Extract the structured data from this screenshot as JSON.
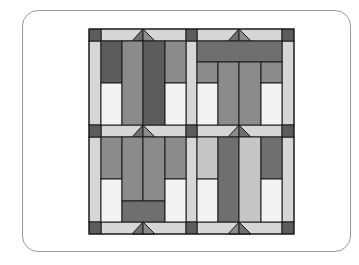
{
  "diagram": {
    "title": "",
    "type": "quilt-block-layout",
    "layout": "2x2 blocks with sashing strips and cornerstones",
    "colors": {
      "dark": "#5c5c5c",
      "medium_dark": "#6f6f6f",
      "medium": "#8b8b8b",
      "light_gray": "#c6c6c6",
      "sashing": "#d6d6d6",
      "white": "#f3f3f3",
      "outline": "#1a1a1a",
      "frame": "#9a9a9a"
    },
    "blocks": [
      {
        "position": "top-left",
        "description": "dark columns flanking, two tall center columns, white lower corners"
      },
      {
        "position": "top-right",
        "description": "horizontal bar on top, two tall center columns, white lower corners"
      },
      {
        "position": "bottom-left",
        "description": "two tall center columns over horizontal bar, white lower corners"
      },
      {
        "position": "bottom-right",
        "description": "light and dark tall columns, white lower corners"
      }
    ]
  }
}
